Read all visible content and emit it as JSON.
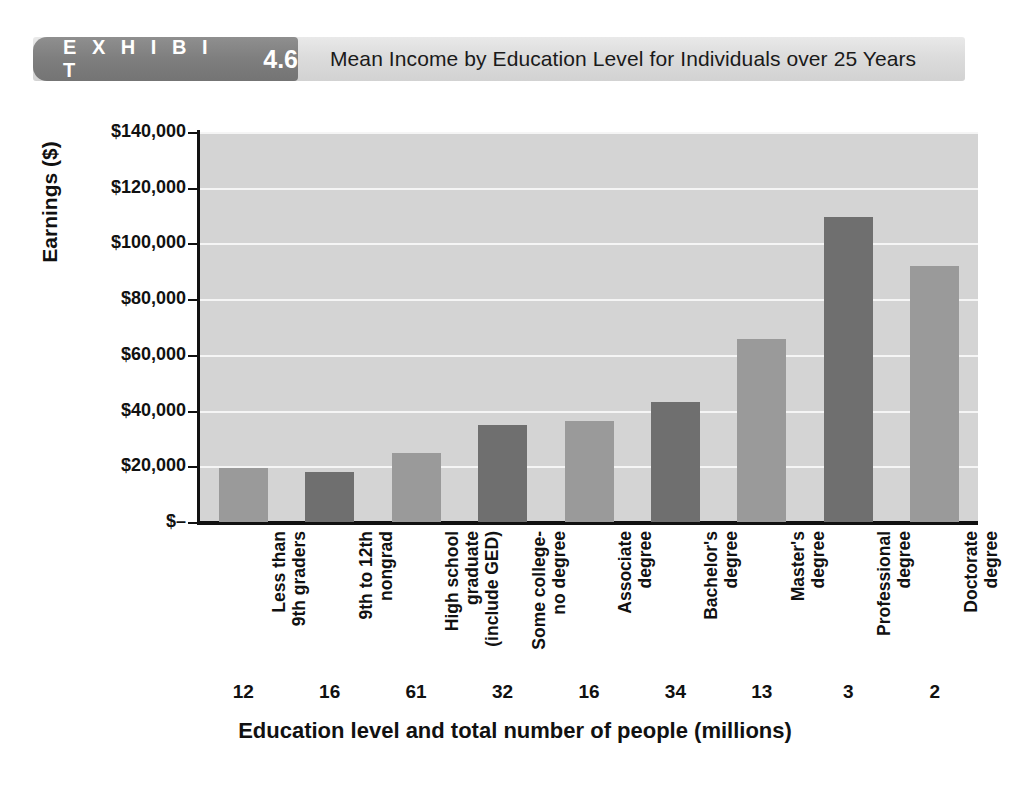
{
  "header": {
    "exhibit_word": "E X H I B I T",
    "exhibit_number": "4.6",
    "title": "Mean Income by Education Level for Individuals over 25 Years",
    "tag_color": "#7e7e7e",
    "bar_color": "#dcdcdc"
  },
  "chart_data": {
    "type": "bar",
    "title": "Mean Income by Education Level for Individuals over 25 Years",
    "xlabel": "Education level and total number of people (millions)",
    "ylabel": "Earnings ($)",
    "ylim": [
      0,
      140000
    ],
    "grid": true,
    "legend": null,
    "categories": [
      "Less than\n9th graders",
      "9th to 12th\nnongrad",
      "High school\ngraduate\n(include GED)",
      "Some college-\nno degree",
      "Associate\ndegree",
      "Bachelor's\ndegree",
      "Master's\ndegree",
      "Professional\ndegree",
      "Doctorate\ndegree"
    ],
    "values": [
      19500,
      17800,
      24800,
      34700,
      36400,
      42900,
      65800,
      109600,
      91800
    ],
    "population_millions": [
      "12",
      "16",
      "61",
      "32",
      "16",
      "34",
      "13",
      "3",
      "2"
    ],
    "bar_colors": [
      "#9a9a9a",
      "#6f6f6f",
      "#9a9a9a",
      "#6f6f6f",
      "#9a9a9a",
      "#6f6f6f",
      "#9a9a9a",
      "#6f6f6f",
      "#9a9a9a"
    ],
    "ytick_values": [
      0,
      20000,
      40000,
      60000,
      80000,
      100000,
      120000,
      140000
    ],
    "ytick_labels": [
      "$–",
      "$20,000",
      "$40,000",
      "$60,000",
      "$80,000",
      "$100,000",
      "$120,000",
      "$140,000"
    ],
    "plot_background": "#d4d4d4",
    "gridline_color": "#f5f5f5"
  }
}
